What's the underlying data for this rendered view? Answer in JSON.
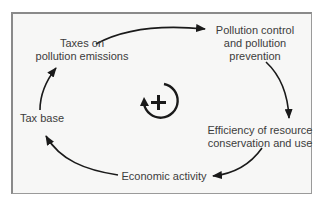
{
  "diagram": {
    "type": "causal-loop",
    "loop_polarity": "+",
    "loop_icon": "reinforcing-loop-icon",
    "nodes": [
      {
        "id": "taxes",
        "lines": [
          "Taxes on",
          "pollution emissions"
        ]
      },
      {
        "id": "pollution_control",
        "lines": [
          "Pollution control",
          "and pollution",
          "prevention"
        ]
      },
      {
        "id": "efficiency",
        "lines": [
          "Efficiency of resource",
          "conservation and use"
        ]
      },
      {
        "id": "economic_activity",
        "lines": [
          "Economic activity"
        ]
      },
      {
        "id": "tax_base",
        "lines": [
          "Tax base"
        ]
      }
    ],
    "edges": [
      {
        "from": "taxes",
        "to": "pollution_control"
      },
      {
        "from": "pollution_control",
        "to": "efficiency"
      },
      {
        "from": "efficiency",
        "to": "economic_activity"
      },
      {
        "from": "economic_activity",
        "to": "tax_base"
      },
      {
        "from": "tax_base",
        "to": "taxes"
      }
    ],
    "colors": {
      "background": "#f7f7f6",
      "frame": "#8a8a8a",
      "text": "#3c3c3c",
      "arrow": "#1a1a1a"
    }
  }
}
